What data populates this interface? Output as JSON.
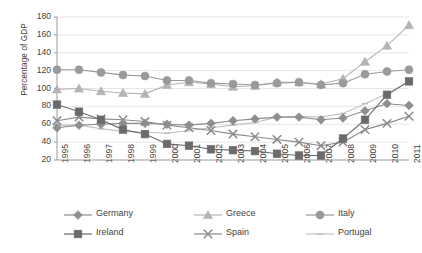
{
  "chart_data": {
    "type": "line",
    "title": "",
    "xlabel": "",
    "ylabel": "Percentage of GDP",
    "ylim": [
      20,
      180
    ],
    "yticks": [
      20,
      40,
      60,
      80,
      100,
      120,
      140,
      160,
      180
    ],
    "grid": true,
    "legend_position": "bottom",
    "categories": [
      "1995",
      "1996",
      "1997",
      "1998",
      "1999",
      "2000",
      "2001",
      "2002",
      "2003",
      "2004",
      "2005",
      "2006",
      "2007",
      "2008",
      "2009",
      "2010",
      "2011"
    ],
    "series": [
      {
        "name": "Germany",
        "marker": "diamond",
        "color": "#8e8e8e",
        "values": [
          56,
          59,
          60,
          61,
          61,
          60,
          59,
          61,
          64,
          66,
          68,
          68,
          65,
          67,
          75,
          83,
          81
        ]
      },
      {
        "name": "Greece",
        "marker": "triangle",
        "color": "#b4b4b4",
        "values": [
          99,
          100,
          97,
          95,
          94,
          104,
          107,
          105,
          102,
          103,
          107,
          107,
          105,
          111,
          130,
          148,
          171
        ]
      },
      {
        "name": "Italy",
        "marker": "circle",
        "color": "#9a9a9a",
        "values": [
          121,
          121,
          118,
          115,
          114,
          109,
          109,
          106,
          105,
          104,
          106,
          107,
          104,
          106,
          116,
          119,
          121
        ]
      },
      {
        "name": "Ireland",
        "marker": "square",
        "color": "#6b6b6b",
        "values": [
          82,
          74,
          65,
          54,
          49,
          38,
          36,
          32,
          31,
          30,
          27,
          25,
          25,
          44,
          65,
          93,
          108
        ]
      },
      {
        "name": "Spain",
        "marker": "x",
        "color": "#8a8a8a",
        "values": [
          64,
          68,
          66,
          65,
          63,
          59,
          56,
          53,
          49,
          46,
          43,
          40,
          36,
          40,
          54,
          61,
          69
        ]
      },
      {
        "name": "Portugal",
        "marker": "dash",
        "color": "#c0c0c0",
        "values": [
          59,
          59,
          55,
          52,
          51,
          50,
          53,
          56,
          59,
          62,
          68,
          69,
          68,
          72,
          83,
          94,
          108
        ]
      }
    ]
  },
  "legend": {
    "items": [
      {
        "label": "Germany"
      },
      {
        "label": "Greece"
      },
      {
        "label": "Italy"
      },
      {
        "label": "Ireland"
      },
      {
        "label": "Spain"
      },
      {
        "label": "Portugal"
      }
    ]
  },
  "axis": {
    "y_title": "Percentage of GDP"
  }
}
